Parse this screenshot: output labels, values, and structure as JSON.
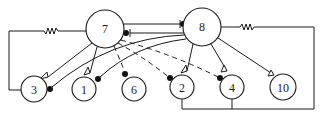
{
  "diagram": {
    "type": "neural-circuit",
    "neurons": [
      {
        "id": "7",
        "label": "7",
        "cx": 105,
        "cy": 29,
        "r": 19
      },
      {
        "id": "8",
        "label": "8",
        "cx": 202,
        "cy": 27,
        "r": 19
      },
      {
        "id": "3",
        "label": "3",
        "cx": 34,
        "cy": 89,
        "r": 13
      },
      {
        "id": "1",
        "label": "1",
        "cx": 84,
        "cy": 89,
        "r": 12
      },
      {
        "id": "6",
        "label": "6",
        "cx": 134,
        "cy": 89,
        "r": 12
      },
      {
        "id": "2",
        "label": "2",
        "cx": 182,
        "cy": 87,
        "r": 12
      },
      {
        "id": "4",
        "label": "4",
        "cx": 232,
        "cy": 87,
        "r": 12
      },
      {
        "id": "10",
        "label": "10",
        "cx": 283,
        "cy": 87,
        "r": 13
      }
    ],
    "connections": [
      {
        "from": "7",
        "to": "8",
        "type": "inhibitory",
        "style": "solid"
      },
      {
        "from": "8",
        "to": "7",
        "type": "inhibitory",
        "style": "solid"
      },
      {
        "from": "7",
        "to": "3",
        "type": "excitatory",
        "style": "solid"
      },
      {
        "from": "7",
        "to": "1",
        "type": "excitatory",
        "style": "solid"
      },
      {
        "from": "7",
        "to": "6",
        "type": "inhibitory",
        "style": "dashed"
      },
      {
        "from": "7",
        "to": "2",
        "type": "inhibitory",
        "style": "dashed"
      },
      {
        "from": "7",
        "to": "4",
        "type": "inhibitory",
        "style": "dashed"
      },
      {
        "from": "8",
        "to": "3",
        "type": "inhibitory",
        "style": "solid"
      },
      {
        "from": "8",
        "to": "1",
        "type": "inhibitory",
        "style": "solid"
      },
      {
        "from": "8",
        "to": "2",
        "type": "excitatory",
        "style": "solid"
      },
      {
        "from": "8",
        "to": "4",
        "type": "excitatory",
        "style": "solid"
      },
      {
        "from": "8",
        "to": "10",
        "type": "excitatory",
        "style": "solid"
      },
      {
        "from": "7",
        "to": "3",
        "type": "electrical-coupling",
        "style": "resistor"
      },
      {
        "from": "8",
        "to": "2",
        "type": "electrical-coupling",
        "style": "resistor"
      },
      {
        "from": "8",
        "to": "4",
        "type": "electrical-coupling",
        "style": "resistor"
      }
    ],
    "legend": {
      "filled_circle": "inhibitory synapse",
      "open_triangle": "excitatory synapse",
      "zigzag": "electrical coupling"
    }
  }
}
